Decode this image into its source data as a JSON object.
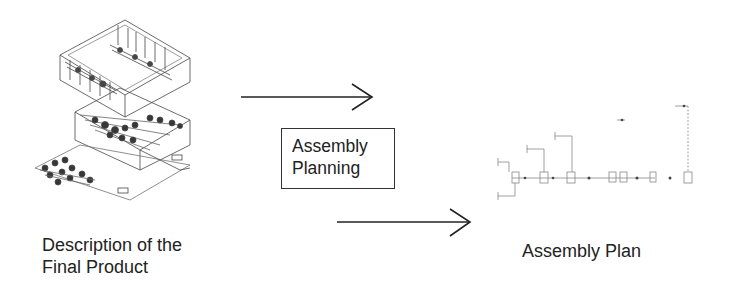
{
  "diagram": {
    "input": {
      "label_line1": "Description of the",
      "label_line2": "Final Product",
      "image": "isometric-wireframe-product-drawing"
    },
    "process": {
      "label_line1": "Assembly",
      "label_line2": "Planning"
    },
    "output": {
      "label": "Assembly Plan",
      "image": "assembly-plan-flow-graph"
    },
    "arrows": [
      {
        "from": "input",
        "to": "process-top",
        "direction": "right"
      },
      {
        "from": "process-bottom",
        "to": "output",
        "direction": "right"
      }
    ],
    "colors": {
      "line": "#222222",
      "background": "#ffffff",
      "faint": "#888888"
    }
  }
}
